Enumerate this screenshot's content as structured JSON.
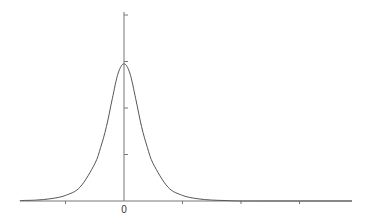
{
  "chart_data": {
    "type": "line",
    "title": "",
    "xlabel": "",
    "ylabel": "",
    "x_tick_labels": [
      "",
      "0",
      "",
      "",
      ""
    ],
    "x_ticks": [
      -1,
      0,
      1,
      2,
      3
    ],
    "y_ticks": [
      0,
      1,
      2,
      3,
      4
    ],
    "xlim": [
      -1.77,
      3.9
    ],
    "ylim": [
      0,
      4.1
    ],
    "grid": false,
    "legend": null,
    "series": [
      {
        "name": "density",
        "description": "bell-shaped peak centered at x=0, peak height ~2.95 (in y-tick units), heavy-ish tails",
        "peak_x": 0,
        "peak_y": 2.95,
        "x": [
          -1.75,
          -1.5,
          -1.25,
          -1.0,
          -0.75,
          -0.5,
          -0.4,
          -0.3,
          -0.2,
          -0.1,
          0,
          0.1,
          0.2,
          0.3,
          0.4,
          0.5,
          0.75,
          1.0,
          1.25,
          1.5,
          1.75,
          2.0,
          2.5
        ],
        "y": [
          0.01,
          0.02,
          0.05,
          0.12,
          0.3,
          0.8,
          1.15,
          1.6,
          2.2,
          2.75,
          2.95,
          2.75,
          2.2,
          1.6,
          1.15,
          0.8,
          0.3,
          0.12,
          0.05,
          0.02,
          0.01,
          0.0,
          0.0
        ]
      }
    ],
    "colors": {
      "axis": "#777777",
      "line": "#555555"
    }
  }
}
